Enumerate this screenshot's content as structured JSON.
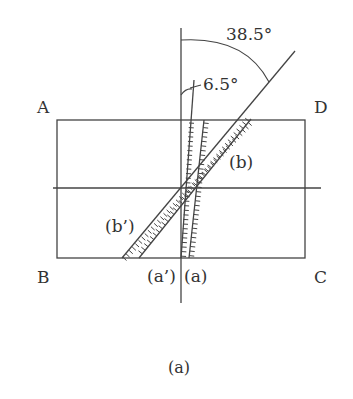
{
  "figure": {
    "caption": "(a)",
    "corners": {
      "A": "A",
      "B": "B",
      "C": "C",
      "D": "D"
    },
    "angles": {
      "large": "38.5°",
      "small": "6.5°"
    },
    "strips": {
      "a": "(a)",
      "a_prime": "(a’)",
      "b": "(b)",
      "b_prime": "(b’)"
    },
    "geometry": {
      "rectangle": {
        "x": 57,
        "y": 120,
        "width": 248,
        "height": 138
      },
      "horizontal_axis_y": 188,
      "vertical_axis_x": 181,
      "angle_a_deg": 6.5,
      "angle_b_deg": 38.5
    },
    "colors": {
      "line": "#444444",
      "text": "#333333",
      "background": "#ffffff"
    }
  }
}
